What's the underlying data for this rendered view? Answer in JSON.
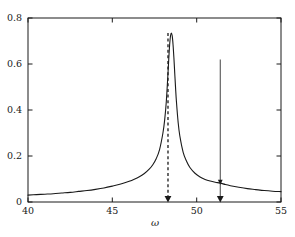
{
  "chart_data": {
    "type": "line",
    "title": "",
    "xlabel": "ω",
    "ylabel": "",
    "xlim": [
      40,
      55
    ],
    "ylim": [
      0,
      0.8
    ],
    "xticks": [
      40,
      45,
      50,
      55
    ],
    "xtick_labels": [
      "40",
      "45",
      "50",
      "55"
    ],
    "yticks": [
      0,
      0.2,
      0.4,
      0.6,
      0.8
    ],
    "ytick_labels": [
      "0",
      "0.2",
      "0.4",
      "0.6",
      "0.8"
    ],
    "grid": false,
    "legend": null,
    "series": [
      {
        "name": "response",
        "style": "solid",
        "color": "#1a1a1a",
        "x": [
          40.0,
          40.5,
          41.0,
          41.5,
          42.0,
          42.5,
          43.0,
          43.5,
          44.0,
          44.5,
          45.0,
          45.5,
          46.0,
          46.3,
          46.6,
          46.9,
          47.2,
          47.4,
          47.6,
          47.8,
          48.0,
          48.1,
          48.2,
          48.3,
          48.35,
          48.4,
          48.45,
          48.5,
          48.55,
          48.6,
          48.65,
          48.7,
          48.75,
          48.8,
          48.9,
          49.0,
          49.2,
          49.4,
          49.6,
          49.9,
          50.2,
          50.5,
          50.8,
          51.1,
          51.4,
          51.7,
          52.0,
          52.5,
          53.0,
          53.5,
          54.0,
          54.5,
          55.0
        ],
        "y": [
          0.03,
          0.032,
          0.034,
          0.036,
          0.039,
          0.042,
          0.046,
          0.05,
          0.055,
          0.061,
          0.069,
          0.078,
          0.09,
          0.099,
          0.11,
          0.124,
          0.144,
          0.162,
          0.188,
          0.228,
          0.3,
          0.355,
          0.437,
          0.56,
          0.628,
          0.686,
          0.723,
          0.735,
          0.722,
          0.684,
          0.627,
          0.56,
          0.495,
          0.437,
          0.348,
          0.288,
          0.216,
          0.177,
          0.15,
          0.125,
          0.109,
          0.098,
          0.091,
          0.086,
          0.082,
          0.076,
          0.071,
          0.064,
          0.058,
          0.054,
          0.05,
          0.047,
          0.045
        ]
      }
    ],
    "annotations": [
      {
        "name": "dashed-arrow-peak",
        "style": "dashed",
        "x": 48.3,
        "y_start": 0.735,
        "y_end": 0.0,
        "arrowhead": "down",
        "color": "#1a1a1a"
      },
      {
        "name": "solid-arrow-secondary",
        "style": "solid",
        "x": 51.4,
        "y_start": 0.62,
        "y_end": 0.0,
        "arrowhead": "down",
        "intermediate_arrowhead_y": 0.088,
        "color": "#1a1a1a"
      }
    ]
  },
  "axes": {
    "x_title": "ω",
    "x_tick_labels": [
      "40",
      "45",
      "50",
      "55"
    ],
    "y_tick_labels": [
      "0",
      "0.2",
      "0.4",
      "0.6",
      "0.8"
    ]
  }
}
